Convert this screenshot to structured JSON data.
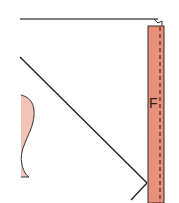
{
  "diagram": {
    "type": "sewing-pattern-fragment",
    "strip_label": "F",
    "colors": {
      "strip_fill": "#e8907a",
      "curve_fill": "#f3c3b8",
      "line": "#222222",
      "top_line": "#555555",
      "stitch": "#5a2a22"
    }
  }
}
